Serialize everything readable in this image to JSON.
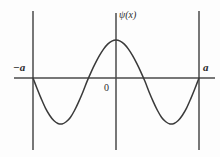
{
  "figure": {
    "title": "",
    "background_color": "#fdfdfd",
    "width": 220,
    "height": 157,
    "labels": {
      "left_boundary": "−a",
      "right_boundary": "a",
      "function_label": "ψ(x)",
      "origin": "0"
    },
    "colors": {
      "curve": "#3a3a3a",
      "axis": "#4a4a4a",
      "boundary_line": "#555555",
      "text": "#2b2b2b"
    }
  },
  "chart_data": {
    "type": "line",
    "title": "ψ(x)",
    "xlabel": "",
    "ylabel": "ψ(x)",
    "xlim": [
      -1,
      1
    ],
    "ylim": [
      -1.25,
      1.05
    ],
    "grid": false,
    "legend": null,
    "tick_labels": {
      "x": [
        "−a",
        "0",
        "a"
      ],
      "y": []
    },
    "annotations": [
      {
        "text": "−a",
        "x": -1,
        "y": 0.28,
        "style": "italic"
      },
      {
        "text": "a",
        "x": 1,
        "y": 0.28,
        "style": "italic"
      },
      {
        "text": "0",
        "x": -0.08,
        "y": -0.18,
        "style": "normal"
      },
      {
        "text": "ψ(x)",
        "x": 0.05,
        "y": 0.95,
        "style": "italic"
      }
    ],
    "boundary_walls": {
      "x_positions": [
        -1,
        0,
        1
      ],
      "y_top": 1.05,
      "y_bottom": -1.25,
      "description": "vertical lines at -a, 0 and a"
    },
    "series": [
      {
        "name": "ψ(x)",
        "description": "standing wave, n=3 particle-in-a-box mode on [-a, a]",
        "x": [
          -1.0,
          -0.95,
          -0.9,
          -0.85,
          -0.8,
          -0.75,
          -0.7,
          -0.65,
          -0.6,
          -0.55,
          -0.5,
          -0.45,
          -0.4,
          -0.35,
          -0.3,
          -0.25,
          -0.2,
          -0.15,
          -0.1,
          -0.05,
          0.0,
          0.05,
          0.1,
          0.15,
          0.2,
          0.25,
          0.3,
          0.35,
          0.4,
          0.45,
          0.5,
          0.55,
          0.6,
          0.65,
          0.7,
          0.75,
          0.8,
          0.85,
          0.9,
          0.95,
          1.0
        ],
        "y": [
          0.0,
          -0.233,
          -0.454,
          -0.655,
          -0.809,
          -0.924,
          -0.988,
          -1.0,
          -0.951,
          -0.858,
          -0.707,
          -0.518,
          -0.309,
          -0.078,
          0.156,
          0.383,
          0.588,
          0.76,
          0.891,
          0.972,
          1.0,
          0.972,
          0.891,
          0.76,
          0.588,
          0.383,
          0.156,
          -0.078,
          -0.309,
          -0.518,
          -0.707,
          -0.858,
          -0.951,
          -1.0,
          -0.988,
          -0.924,
          -0.809,
          -0.655,
          -0.454,
          -0.233,
          0.0
        ]
      }
    ],
    "key_points": {
      "zero_crossings_x": [
        -1.0,
        -0.33,
        0.33,
        1.0
      ],
      "maxima": [
        {
          "x": 0.0,
          "y": 1.0
        }
      ],
      "minima": [
        {
          "x": -0.66,
          "y": -1.0
        },
        {
          "x": 0.66,
          "y": -1.0
        }
      ]
    }
  }
}
